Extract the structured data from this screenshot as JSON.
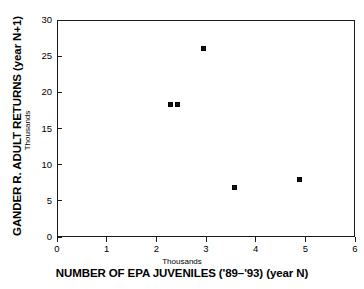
{
  "chart_data": {
    "type": "scatter",
    "title": "",
    "xlabel": "NUMBER OF EPA JUVENILES ('89–'93) (year N)",
    "xlabel_units": "Thousands",
    "ylabel": "GANDER R. ADULT RETURNS (year N+1)",
    "ylabel_units": "Thousands",
    "xlim": [
      0,
      6
    ],
    "ylim": [
      0,
      30
    ],
    "xticks": [
      0,
      1,
      2,
      3,
      4,
      5,
      6
    ],
    "xtick_labels": [
      "0",
      "1",
      "2",
      "3",
      "4",
      "5",
      "6"
    ],
    "yticks": [
      0,
      5,
      10,
      15,
      20,
      25,
      30
    ],
    "ytick_labels": [
      "0",
      "5",
      "10",
      "15",
      "20",
      "25",
      "30"
    ],
    "grid": false,
    "legend": false,
    "marker": "filled-square",
    "marker_color": "#111111",
    "points": [
      {
        "x": 2.28,
        "y": 18.3
      },
      {
        "x": 2.42,
        "y": 18.3
      },
      {
        "x": 2.95,
        "y": 26.1
      },
      {
        "x": 3.58,
        "y": 6.9
      },
      {
        "x": 4.88,
        "y": 7.9
      }
    ]
  },
  "axis_colors": {
    "frame": "#1a1a1a",
    "background": "#ffffff"
  }
}
